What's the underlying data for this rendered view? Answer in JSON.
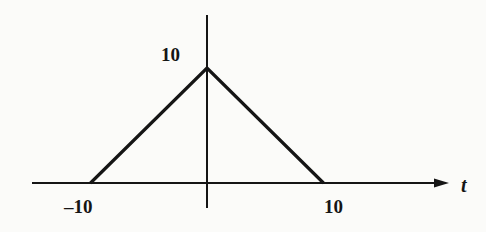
{
  "chart_data": {
    "type": "line",
    "title": "",
    "xlabel": "t",
    "ylabel": "",
    "x": [
      -10,
      0,
      10
    ],
    "y": [
      0,
      10,
      0
    ],
    "series": [
      {
        "name": "triangular pulse",
        "x": [
          -10,
          0,
          10
        ],
        "y": [
          0,
          10,
          0
        ]
      }
    ],
    "xticks": [
      "-10",
      "10"
    ],
    "yticks": [
      "10"
    ],
    "xlim": [
      -15,
      20
    ],
    "ylim": [
      0,
      10
    ],
    "grid": false,
    "legend": null
  },
  "labels": {
    "peak": "10",
    "x_left": "–10",
    "x_right": "10",
    "x_axis_var": "t"
  },
  "colors": {
    "ink": "#151515",
    "background": "#fbfbf9"
  }
}
